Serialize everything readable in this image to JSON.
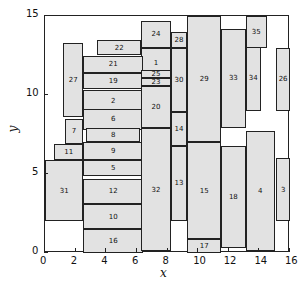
{
  "chart_data": {
    "type": "rectangle-packing",
    "xlabel": "x",
    "ylabel": "y",
    "xlim": [
      0,
      16
    ],
    "ylim": [
      0,
      15
    ],
    "xticks": [
      "0",
      "2",
      "4",
      "6",
      "8",
      "10",
      "12",
      "14",
      "16"
    ],
    "yticks": [
      "0",
      "5",
      "10",
      "15"
    ],
    "fill_color": "#e2e2e2",
    "edge_color": "#222222",
    "rects": [
      {
        "id": "1",
        "x": 6.3,
        "y": 11.1,
        "w": 1.9,
        "h": 1.9
      },
      {
        "id": "2",
        "x": 2.5,
        "y": 9.0,
        "w": 3.9,
        "h": 1.3
      },
      {
        "id": "3",
        "x": 15.1,
        "y": 2.0,
        "w": 0.9,
        "h": 4.0
      },
      {
        "id": "4",
        "x": 13.1,
        "y": 0.1,
        "w": 1.9,
        "h": 7.6
      },
      {
        "id": "5",
        "x": 2.5,
        "y": 4.9,
        "w": 3.9,
        "h": 1.0
      },
      {
        "id": "6",
        "x": 2.5,
        "y": 7.8,
        "w": 3.9,
        "h": 1.3
      },
      {
        "id": "7",
        "x": 1.3,
        "y": 6.9,
        "w": 1.2,
        "h": 1.6
      },
      {
        "id": "8",
        "x": 2.7,
        "y": 7.0,
        "w": 3.5,
        "h": 0.9
      },
      {
        "id": "9",
        "x": 2.5,
        "y": 5.9,
        "w": 3.9,
        "h": 1.1
      },
      {
        "id": "10",
        "x": 2.5,
        "y": 1.5,
        "w": 3.9,
        "h": 1.6
      },
      {
        "id": "11",
        "x": 0.6,
        "y": 5.9,
        "w": 1.9,
        "h": 1.0
      },
      {
        "id": "12",
        "x": 2.5,
        "y": 3.1,
        "w": 3.9,
        "h": 1.6
      },
      {
        "id": "13",
        "x": 8.2,
        "y": 2.0,
        "w": 1.1,
        "h": 4.8
      },
      {
        "id": "14",
        "x": 8.2,
        "y": 6.8,
        "w": 1.1,
        "h": 2.1
      },
      {
        "id": "15",
        "x": 9.3,
        "y": 0.9,
        "w": 2.2,
        "h": 6.1
      },
      {
        "id": "16",
        "x": 2.5,
        "y": 0.0,
        "w": 3.9,
        "h": 1.5
      },
      {
        "id": "17",
        "x": 9.3,
        "y": 0.0,
        "w": 2.2,
        "h": 0.9
      },
      {
        "id": "18",
        "x": 11.5,
        "y": 0.3,
        "w": 1.6,
        "h": 6.5
      },
      {
        "id": "19",
        "x": 2.5,
        "y": 10.4,
        "w": 3.9,
        "h": 1.0
      },
      {
        "id": "20",
        "x": 6.3,
        "y": 7.9,
        "w": 1.9,
        "h": 2.7
      },
      {
        "id": "21",
        "x": 2.5,
        "y": 11.4,
        "w": 3.9,
        "h": 1.1
      },
      {
        "id": "22",
        "x": 3.4,
        "y": 12.5,
        "w": 2.9,
        "h": 1.0
      },
      {
        "id": "23",
        "x": 6.3,
        "y": 10.6,
        "w": 1.9,
        "h": 0.5
      },
      {
        "id": "24",
        "x": 6.3,
        "y": 13.0,
        "w": 1.9,
        "h": 1.7
      },
      {
        "id": "25",
        "x": 6.3,
        "y": 11.1,
        "w": 1.9,
        "h": 0.5
      },
      {
        "id": "26",
        "x": 15.1,
        "y": 9.0,
        "w": 0.9,
        "h": 4.0
      },
      {
        "id": "27",
        "x": 1.2,
        "y": 8.6,
        "w": 1.3,
        "h": 4.7
      },
      {
        "id": "28",
        "x": 8.2,
        "y": 13.0,
        "w": 1.1,
        "h": 1.0
      },
      {
        "id": "29",
        "x": 9.3,
        "y": 7.0,
        "w": 2.2,
        "h": 8.0
      },
      {
        "id": "30",
        "x": 8.2,
        "y": 8.9,
        "w": 1.1,
        "h": 4.1
      },
      {
        "id": "31",
        "x": 0.0,
        "y": 2.0,
        "w": 2.5,
        "h": 3.9
      },
      {
        "id": "32",
        "x": 6.3,
        "y": 0.1,
        "w": 1.9,
        "h": 7.8
      },
      {
        "id": "33",
        "x": 11.5,
        "y": 7.9,
        "w": 1.6,
        "h": 6.3
      },
      {
        "id": "34",
        "x": 13.1,
        "y": 9.0,
        "w": 1.0,
        "h": 4.1
      },
      {
        "id": "35",
        "x": 13.1,
        "y": 13.0,
        "w": 1.4,
        "h": 2.0
      }
    ]
  }
}
